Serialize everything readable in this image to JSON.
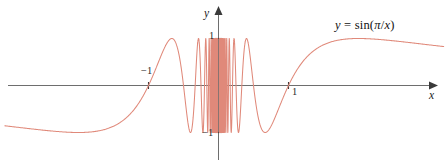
{
  "figure": {
    "width": 448,
    "height": 166,
    "background": "#ffffff"
  },
  "axes": {
    "x_label": "x",
    "y_label": "y",
    "axis_color": "#6e6e6e",
    "x_ticks": [
      {
        "value": -1,
        "label": "−1"
      },
      {
        "value": 1,
        "label": "1"
      }
    ],
    "y_ticks": [
      {
        "value": 1,
        "label": "1"
      },
      {
        "value": -1,
        "label": "−1"
      }
    ]
  },
  "annotation": {
    "equation": "y = sin(π/x)",
    "equation_parts": {
      "lhs": "y",
      "equals": "=",
      "fn": "sin",
      "open": "(",
      "pi": "π",
      "slash": "/",
      "var": "x",
      "close": ")"
    }
  },
  "chart_data": {
    "type": "line",
    "title": "",
    "subtitle": "",
    "xlabel": "x",
    "ylabel": "y",
    "xlim": [
      -3.1,
      3.2
    ],
    "ylim": [
      -1.35,
      1.45
    ],
    "grid": false,
    "legend": null,
    "curve_color": "#e0897a",
    "annotations": [
      {
        "text": "y = sin(π/x)",
        "x": 1.75,
        "y": 1.3
      }
    ],
    "function": "y = sin(pi/x)",
    "series": [
      {
        "name": "sin(pi/x)",
        "x": [
          -3.1,
          -3.0,
          -2.8,
          -2.6,
          -2.4,
          -2.2,
          -2.0,
          -1.9,
          -1.8,
          -1.7,
          -1.6,
          -1.5,
          -1.4,
          -1.3,
          -1.2,
          -1.1,
          -1.0,
          -0.9,
          -0.8,
          -0.7,
          -0.6,
          -0.55,
          -0.5,
          -0.45,
          -0.4,
          -0.36,
          -0.333,
          -0.3,
          -0.28,
          -0.25,
          -0.22,
          -0.2,
          -0.18,
          -0.167,
          -0.15,
          -0.14,
          -0.125,
          -0.11,
          -0.1,
          -0.09,
          -0.083,
          -0.07,
          -0.0625,
          -0.05,
          -0.04,
          -0.03,
          0.03,
          0.04,
          0.05,
          0.0625,
          0.07,
          0.083,
          0.09,
          0.1,
          0.11,
          0.125,
          0.14,
          0.15,
          0.167,
          0.18,
          0.2,
          0.22,
          0.25,
          0.28,
          0.3,
          0.333,
          0.36,
          0.4,
          0.45,
          0.5,
          0.55,
          0.6,
          0.7,
          0.8,
          0.9,
          1.0,
          1.1,
          1.2,
          1.3,
          1.4,
          1.5,
          1.6,
          1.7,
          1.8,
          1.9,
          2.0,
          2.2,
          2.4,
          2.6,
          2.8,
          3.0,
          3.1
        ],
        "y": [
          -0.947,
          -0.866,
          -0.782,
          -0.688,
          -0.583,
          -0.464,
          -0.327,
          -0.251,
          -0.172,
          -0.091,
          -0.006,
          0.082,
          0.174,
          0.271,
          0.373,
          0.481,
          0.596,
          0.719,
          0.85,
          0.975,
          0.866,
          0.541,
          0.0,
          -0.74,
          -0.951,
          -0.342,
          0.0,
          0.866,
          0.782,
          -0.866,
          -0.602,
          0.0,
          0.643,
          0.0,
          -0.866,
          -0.782,
          0.0,
          -0.541,
          0.0,
          0.342,
          0.0,
          -0.975,
          0.0,
          0.0,
          0.0,
          0.0,
          0.0,
          0.0,
          0.0,
          0.0,
          0.975,
          0.0,
          -0.342,
          0.0,
          0.541,
          0.0,
          0.782,
          0.866,
          0.0,
          -0.643,
          0.0,
          0.602,
          0.866,
          -0.782,
          -0.866,
          0.0,
          0.342,
          0.951,
          0.74,
          0.0,
          -0.541,
          -0.866,
          -0.975,
          -0.85,
          -0.719,
          -0.596,
          -0.481,
          -0.373,
          -0.271,
          -0.174,
          -0.082,
          0.006,
          0.091,
          0.172,
          0.251,
          0.327,
          0.464,
          0.583,
          0.688,
          0.782,
          0.866,
          0.947
        ]
      }
    ]
  }
}
